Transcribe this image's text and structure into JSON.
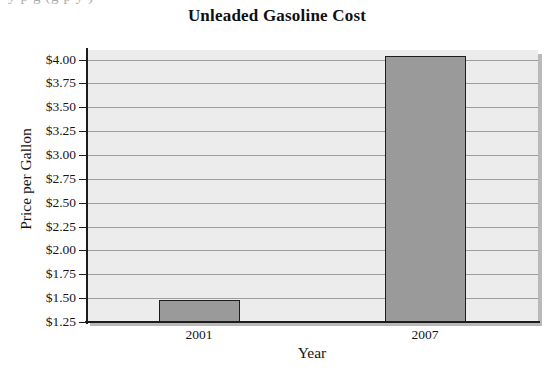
{
  "scan_artifact": {
    "clipped_text": "y    p                                   g (g   p        y    )"
  },
  "chart_data": {
    "type": "bar",
    "title": "Unleaded Gasoline Cost",
    "xlabel": "Year",
    "ylabel": "Price per Gallon",
    "categories": [
      "2001",
      "2007"
    ],
    "values": [
      1.48,
      4.04
    ],
    "ylim": [
      1.25,
      4.1
    ],
    "ytick_values": [
      1.25,
      1.5,
      1.75,
      2.0,
      2.25,
      2.5,
      2.75,
      3.0,
      3.25,
      3.5,
      3.75,
      4.0
    ],
    "ytick_labels": [
      "$1.25",
      "$1.50",
      "$1.75",
      "$2.00",
      "$2.25",
      "$2.50",
      "$2.75",
      "$3.00",
      "$3.25",
      "$3.50",
      "$3.75",
      "$4.00"
    ],
    "grid": true,
    "legend": "none",
    "colors": {
      "bar_fill": "#9a9a9a",
      "bar_border": "#1d1d1d",
      "plot_background": "#ececec",
      "gridline": "#9d9d9d",
      "axis": "#1c1c1c",
      "text": "#161616"
    }
  }
}
